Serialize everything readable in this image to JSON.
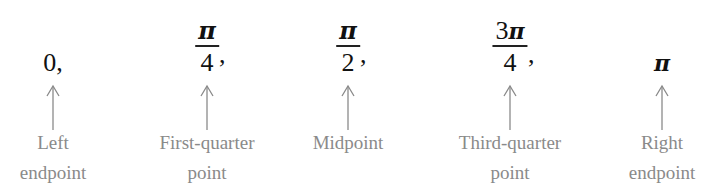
{
  "diagram": {
    "points": [
      {
        "kind": "plain",
        "text": "0",
        "suffix": ",",
        "label_line1": "Left",
        "label_line2": "endpoint"
      },
      {
        "kind": "fraction",
        "numerator": "π",
        "denominator": "4",
        "suffix": ",",
        "label_line1": "First-quarter",
        "label_line2": "point"
      },
      {
        "kind": "fraction",
        "numerator": "π",
        "denominator": "2",
        "suffix": ",",
        "label_line1": "Midpoint",
        "label_line2": ""
      },
      {
        "kind": "fraction",
        "numerator_coef": "3",
        "numerator": "π",
        "denominator": "4",
        "suffix": ",",
        "label_line1": "Third-quarter",
        "label_line2": "point"
      },
      {
        "kind": "plain",
        "text": "π",
        "suffix": "",
        "label_line1": "Right",
        "label_line2": "endpoint"
      }
    ],
    "colors": {
      "expression": "#111111",
      "label": "#8a8a8a",
      "arrow": "#8a8a8a",
      "background": "#ffffff"
    }
  }
}
